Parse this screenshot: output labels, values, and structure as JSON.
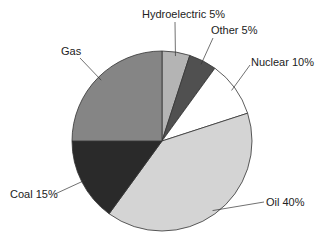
{
  "chart_data": {
    "type": "pie",
    "title": "",
    "slices": [
      {
        "label": "Hydroelectric",
        "value": 5,
        "display": "Hydroelectric 5%",
        "color": "#b4b4b4"
      },
      {
        "label": "Other",
        "value": 5,
        "display": "Other 5%",
        "color": "#505050"
      },
      {
        "label": "Nuclear",
        "value": 10,
        "display": "Nuclear 10%",
        "color": "#ffffff"
      },
      {
        "label": "Oil",
        "value": 40,
        "display": "Oil 40%",
        "color": "#d4d4d4"
      },
      {
        "label": "Coal",
        "value": 15,
        "display": "Coal 15%",
        "color": "#2a2a2a"
      },
      {
        "label": "Gas",
        "value": 25,
        "display": "Gas",
        "color": "#858585"
      }
    ],
    "start_angle_deg": 0,
    "direction": "clockwise",
    "legend": "none",
    "labels_outside_with_leader_lines": true
  }
}
